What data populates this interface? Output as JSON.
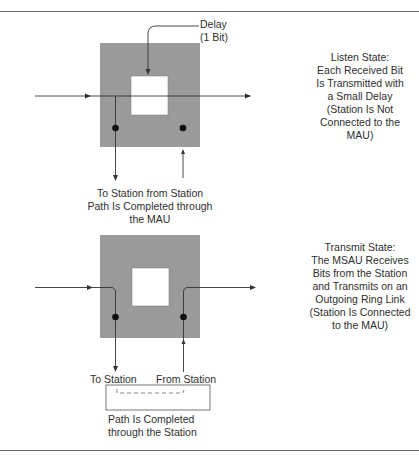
{
  "colors": {
    "block_fill": "#9a9a9a",
    "inner_fill": "#ffffff",
    "line": "#333333",
    "dot": "#111111",
    "rule": "#6b6b6b"
  },
  "listen_state": {
    "delay_label": [
      "Delay",
      "(1 Bit)"
    ],
    "description": [
      "Listen State:",
      "Each Received Bit",
      "Is Transmitted with",
      "a Small Delay",
      "(Station Is Not",
      "Connected to the",
      "MAU)"
    ],
    "caption": [
      "To Station from Station",
      "Path Is Completed through",
      "the MAU"
    ]
  },
  "transmit_state": {
    "description": [
      "Transmit State:",
      "The MSAU Receives",
      "Bits from the Station",
      "and Transmits on an",
      "Outgoing Ring Link",
      "(Station Is Connected",
      "to the MAU)"
    ],
    "to_station_label": "To Station",
    "from_station_label": "From Station",
    "caption": [
      "Path Is Completed",
      "through the Station"
    ]
  }
}
